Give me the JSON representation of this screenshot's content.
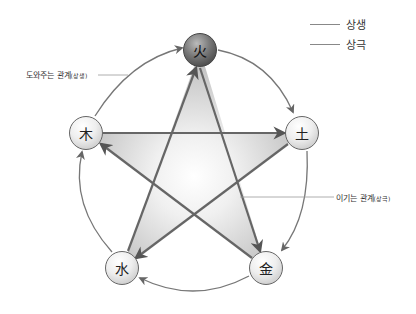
{
  "legend": {
    "items": [
      {
        "label": "상생"
      },
      {
        "label": "상극"
      }
    ]
  },
  "annotations": {
    "generating": {
      "main": "도와주는 관계",
      "sub": "(상생)"
    },
    "overcoming": {
      "main": "이기는 관계",
      "sub": "(상극)"
    }
  },
  "nodes": {
    "fire": {
      "label": "火"
    },
    "earth": {
      "label": "土"
    },
    "metal": {
      "label": "金"
    },
    "water": {
      "label": "水"
    },
    "wood": {
      "label": "木"
    }
  },
  "colors": {
    "line": "#777777",
    "star_stroke": "#666666",
    "star_fill": "#cfcfcf"
  }
}
